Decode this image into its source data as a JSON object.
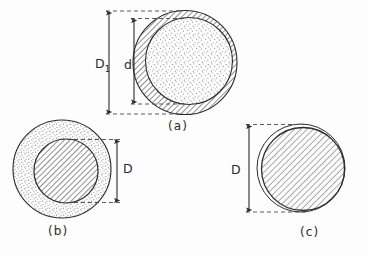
{
  "figure": {
    "type": "technical-diagram",
    "background_color": "#fdfdfd",
    "line_color": "#2b2b2b",
    "hatch_color": "#6e6e6e",
    "stipple_color": "#8a8a8a",
    "panels": [
      {
        "id": "a",
        "label": "(a)",
        "outer_fill": "hatched",
        "inner_fill": "stippled",
        "dimensions": [
          {
            "name": "D1",
            "text": "D",
            "subscript": "1",
            "arrow": "double",
            "side": "left"
          },
          {
            "name": "d",
            "text": "d",
            "subscript": "",
            "arrow": "double",
            "side": "left"
          }
        ]
      },
      {
        "id": "b",
        "label": "(b)",
        "outer_fill": "stippled",
        "inner_fill": "hatched",
        "dimensions": [
          {
            "name": "D",
            "text": "D",
            "subscript": "",
            "arrow": "double",
            "side": "right"
          }
        ]
      },
      {
        "id": "c",
        "label": "(c)",
        "outer_fill": "outline",
        "inner_fill": "hatched",
        "dimensions": [
          {
            "name": "D",
            "text": "D",
            "subscript": "",
            "arrow": "double",
            "side": "left"
          }
        ]
      }
    ]
  },
  "labels": {
    "D1_main": "D",
    "D1_sub": "1",
    "d": "d",
    "D_b": "D",
    "D_c": "D",
    "panel_a": "(a)",
    "panel_b": "(b)",
    "panel_c": "(c)"
  }
}
